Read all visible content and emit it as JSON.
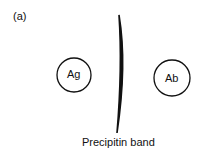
{
  "figure": {
    "panel_label": "(a)",
    "wells": [
      {
        "label": "Ag",
        "cx": 74,
        "cy": 75,
        "r": 17
      },
      {
        "label": "Ab",
        "cx": 172,
        "cy": 78,
        "r": 18
      }
    ],
    "band_label": "Precipitin band",
    "colors": {
      "stroke": "#111111",
      "background": "#ffffff"
    }
  }
}
